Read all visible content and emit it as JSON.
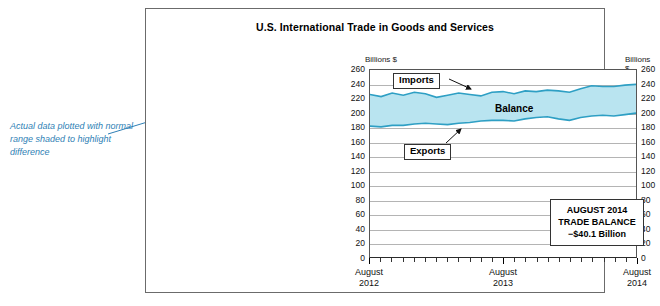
{
  "figure": {
    "title": "U.S. International Trade in Goods and Services",
    "units_left": "Billions $",
    "units_right": "Billions $",
    "annotation": "Actual data plotted with normal range shaded to highlight difference",
    "series_labels": {
      "imports": "Imports",
      "balance": "Balance",
      "exports": "Exports"
    },
    "stat_box": {
      "line1": "AUGUST 2014",
      "line2": "TRADE BALANCE",
      "line3": "−$40.1 Billion"
    },
    "colors": {
      "line": "#2e9fc4",
      "fill": "#b9e4f0",
      "annotation": "#2f7fb5",
      "grid": "#b4b4b4",
      "frame": "#6b6b6b"
    }
  },
  "chart_data": {
    "type": "area",
    "title": "U.S. International Trade in Goods and Services",
    "subtitle": "",
    "xlabel": "",
    "ylabel": "Billions $",
    "ylim": [
      0,
      260
    ],
    "ytick_step": 20,
    "yticks": [
      0,
      20,
      40,
      60,
      80,
      100,
      120,
      140,
      160,
      180,
      200,
      220,
      240,
      260
    ],
    "grid": true,
    "legend_position": "inline-annotations",
    "x_tick_labels": [
      {
        "label": "August",
        "year": "2012",
        "position": 0
      },
      {
        "label": "August",
        "year": "2013",
        "position": 12
      },
      {
        "label": "August",
        "year": "2014",
        "position": 24
      }
    ],
    "x": [
      "2012-08",
      "2012-09",
      "2012-10",
      "2012-11",
      "2012-12",
      "2013-01",
      "2013-02",
      "2013-03",
      "2013-04",
      "2013-05",
      "2013-06",
      "2013-07",
      "2013-08",
      "2013-09",
      "2013-10",
      "2013-11",
      "2013-12",
      "2014-01",
      "2014-02",
      "2014-03",
      "2014-04",
      "2014-05",
      "2014-06",
      "2014-07",
      "2014-08"
    ],
    "series": [
      {
        "name": "Imports",
        "values": [
          226,
          223,
          228,
          225,
          229,
          227,
          222,
          225,
          228,
          226,
          224,
          229,
          230,
          227,
          231,
          230,
          232,
          231,
          229,
          234,
          238,
          237,
          237,
          239,
          240
        ]
      },
      {
        "name": "Exports",
        "values": [
          182,
          181,
          183,
          183,
          185,
          186,
          185,
          184,
          186,
          187,
          189,
          190,
          190,
          189,
          192,
          194,
          195,
          192,
          190,
          194,
          196,
          197,
          196,
          198,
          200
        ]
      }
    ],
    "shaded_band": {
      "name": "Balance",
      "between": [
        "Exports",
        "Imports"
      ],
      "fill": "#b9e4f0"
    },
    "annotations": [
      {
        "text": "Imports",
        "target_series": "Imports"
      },
      {
        "text": "Balance",
        "target_series": "Balance"
      },
      {
        "text": "Exports",
        "target_series": "Exports"
      },
      {
        "text": "AUGUST 2014 TRADE BALANCE −$40.1 Billion",
        "value": -40.1,
        "period": "2014-08"
      },
      {
        "text": "Actual data plotted with normal range shaded to highlight difference"
      }
    ]
  }
}
